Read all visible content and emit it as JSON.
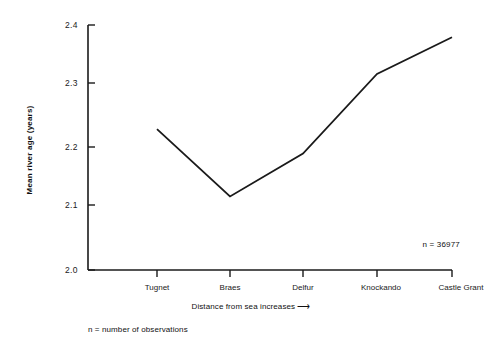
{
  "chart_data": {
    "type": "line",
    "title": "",
    "subtitle": "",
    "categories": [
      "Tugnet",
      "Braes",
      "Delfur",
      "Knockando",
      "Castle Grant"
    ],
    "values": [
      2.23,
      2.12,
      2.19,
      2.32,
      2.38
    ],
    "series": [
      {
        "name": "Mean river age",
        "values": [
          2.23,
          2.12,
          2.19,
          2.32,
          2.38
        ]
      }
    ],
    "xlabel": "Distance from sea increases",
    "xlabel_arrow": "⟶",
    "ylabel": "Mean river age (years)",
    "ylim": [
      2.0,
      2.4
    ],
    "yticks": [
      "2.0",
      "2.1",
      "2.2",
      "2.3",
      "2.4"
    ],
    "ytick_values": [
      2.0,
      2.1,
      2.2,
      2.3,
      2.4
    ],
    "grid": false,
    "legend": "none",
    "line_color": "#1a1a1a",
    "axis_color": "#1a1a1a",
    "background_color": "#ffffff",
    "annotations": [
      {
        "text": "n = 36977",
        "position": "inside-bottom-right"
      },
      {
        "text": "n = number of observations",
        "position": "below-axis-left"
      }
    ]
  }
}
